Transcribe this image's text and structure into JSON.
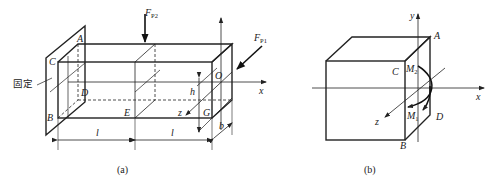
{
  "figure_a": {
    "caption": "(a)",
    "fixed_label": "固定",
    "force_p2": {
      "main": "F",
      "sub": "P2"
    },
    "force_p1": {
      "main": "F",
      "sub": "P1"
    },
    "points": {
      "A": "A",
      "B": "B",
      "C": "C",
      "D": "D",
      "E": "E",
      "G": "G",
      "O": "O"
    },
    "axes": {
      "x": "x",
      "z": "z"
    },
    "dims": {
      "h": "h",
      "b": "b",
      "l1": "l",
      "l2": "l"
    }
  },
  "figure_b": {
    "caption": "(b)",
    "points": {
      "A": "A",
      "B": "B",
      "C": "C",
      "D": "D"
    },
    "axes": {
      "x": "x",
      "y": "y",
      "z": "z"
    },
    "moments": {
      "m2": {
        "main": "M",
        "sub": "2"
      },
      "m1": {
        "main": "M",
        "sub": "1"
      }
    }
  }
}
